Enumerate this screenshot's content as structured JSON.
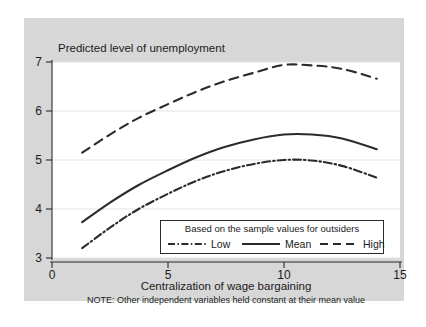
{
  "figure": {
    "background_color": "#ffffff",
    "panel_color": "#d7d7d7",
    "plot_color": "#ffffff",
    "line_color": "#2b2b2b"
  },
  "chart_data": {
    "type": "line",
    "title": "Predicted level of unemployment",
    "xlabel": "Centralization of wage bargaining",
    "ylabel": "",
    "note": "NOTE: Other independent variables held constant at their mean value",
    "xlim": [
      0,
      15
    ],
    "ylim": [
      3,
      7
    ],
    "xticks": [
      0,
      5,
      10,
      15
    ],
    "yticks": [
      3,
      4,
      5,
      6,
      7
    ],
    "grid": "horizontal",
    "legend_position": "inside-bottom-right",
    "legend_title": "Based on the sample values for outsiders",
    "x": [
      1.3,
      2.5,
      3.7,
      5.0,
      6.2,
      7.4,
      8.7,
      10.0,
      11.2,
      12.5,
      14.0
    ],
    "series": [
      {
        "name": "Low",
        "style": "dash-dot",
        "values": [
          3.2,
          3.62,
          3.99,
          4.31,
          4.57,
          4.77,
          4.92,
          5.0,
          4.99,
          4.88,
          4.64
        ]
      },
      {
        "name": "Mean",
        "style": "solid",
        "values": [
          3.73,
          4.13,
          4.48,
          4.79,
          5.05,
          5.26,
          5.42,
          5.52,
          5.52,
          5.44,
          5.22
        ]
      },
      {
        "name": "High",
        "style": "dash",
        "values": [
          5.15,
          5.52,
          5.85,
          6.14,
          6.39,
          6.6,
          6.78,
          6.94,
          6.93,
          6.86,
          6.66
        ]
      }
    ]
  },
  "axis": {
    "y_tick_labels": [
      "7",
      "6",
      "5",
      "4",
      "3"
    ],
    "x_tick_labels": [
      "0",
      "5",
      "10",
      "15"
    ]
  },
  "legend": {
    "heading": "Based on the sample values for outsiders",
    "entries": [
      {
        "label": "Low",
        "style": "dash-dot"
      },
      {
        "label": "Mean",
        "style": "solid"
      },
      {
        "label": "High",
        "style": "dash"
      }
    ]
  }
}
